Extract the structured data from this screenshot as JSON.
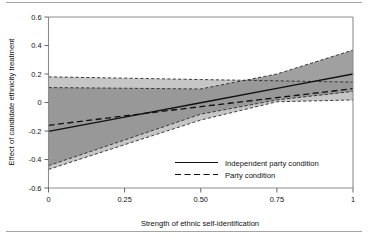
{
  "chart_data": {
    "type": "line",
    "title": "",
    "xlabel": "Strength of ethnic self-identification",
    "ylabel": "Effect of candidate ethnicity treatment",
    "xlim": [
      0,
      1
    ],
    "ylim": [
      -0.6,
      0.6
    ],
    "xticks": [
      0,
      0.25,
      0.5,
      0.75,
      1
    ],
    "xticklabels": [
      "0",
      "0.25",
      "0.50",
      "0.75",
      "1"
    ],
    "yticks": [
      -0.6,
      -0.4,
      -0.2,
      0,
      0.2,
      0.4,
      0.6
    ],
    "yticklabels": [
      "-0.6",
      "-0.4",
      "-0.2",
      "0",
      "0.2",
      "0.4",
      "0.6"
    ],
    "grid": false,
    "legend_position": "lower right",
    "series": [
      {
        "name": "Independent party condition",
        "style": "solid",
        "color": "#111111",
        "x": [
          0,
          0.25,
          0.5,
          0.75,
          1
        ],
        "values": [
          -0.203,
          -0.103,
          -0.002,
          0.099,
          0.2
        ],
        "ci_label": "95% confidence interval",
        "ci_fill": "#8f8f8f",
        "ci_lower": [
          -0.443,
          -0.263,
          -0.082,
          0.018,
          0.078
        ],
        "ci_upper": [
          0.105,
          0.1,
          0.095,
          0.2,
          0.368
        ]
      },
      {
        "name": "Party condition",
        "style": "dashed",
        "color": "#111111",
        "x": [
          0,
          0.25,
          0.5,
          0.75,
          1
        ],
        "values": [
          -0.16,
          -0.094,
          -0.029,
          0.034,
          0.097
        ],
        "ci_label": "95% confidence interval",
        "ci_fill": "#c3c3c3",
        "ci_lower": [
          -0.47,
          -0.296,
          -0.123,
          0.005,
          0.018
        ],
        "ci_upper": [
          0.18,
          0.171,
          0.161,
          0.152,
          0.143
        ]
      }
    ],
    "legend_entries": [
      {
        "label": "Independent party condition",
        "style": "solid"
      },
      {
        "label": "Party condition",
        "style": "dashed"
      }
    ]
  },
  "axes": {
    "y_title": "Effect of candidate ethnicity treatment",
    "x_title": "Strength of ethnic self-identification"
  },
  "colors": {
    "ci_dark": "#8f8f8f",
    "ci_light": "#c3c3c3",
    "line": "#111111",
    "frame": "#8d8d8d",
    "background": "#ffffff"
  }
}
